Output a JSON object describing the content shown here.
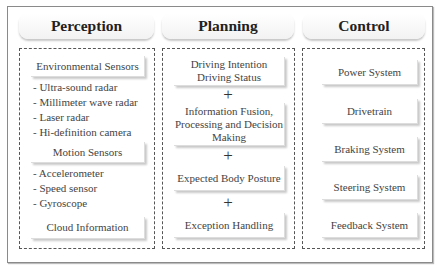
{
  "columns": [
    {
      "title": "Perception",
      "groups": [
        {
          "header": "Environmental Sensors",
          "items": [
            "- Ultra-sound radar",
            "- Millimeter wave radar",
            "- Laser radar",
            "- Hi-definition camera"
          ]
        },
        {
          "header": "Motion Sensors",
          "items": [
            "- Accelerometer",
            "- Speed sensor",
            "- Gyroscope"
          ]
        },
        {
          "header": "Cloud Information",
          "items": []
        }
      ]
    },
    {
      "title": "Planning",
      "boxes": [
        {
          "lines": [
            "Driving Intention",
            "Driving Status"
          ]
        },
        {
          "lines": [
            "Information Fusion,",
            "Processing and Decision",
            "Making"
          ]
        },
        {
          "lines": [
            "Expected Body Posture"
          ]
        },
        {
          "lines": [
            "Exception Handling"
          ]
        }
      ],
      "connector": "+"
    },
    {
      "title": "Control",
      "boxes": [
        "Power System",
        "Drivetrain",
        "Braking System",
        "Steering System",
        "Feedback System"
      ]
    }
  ]
}
